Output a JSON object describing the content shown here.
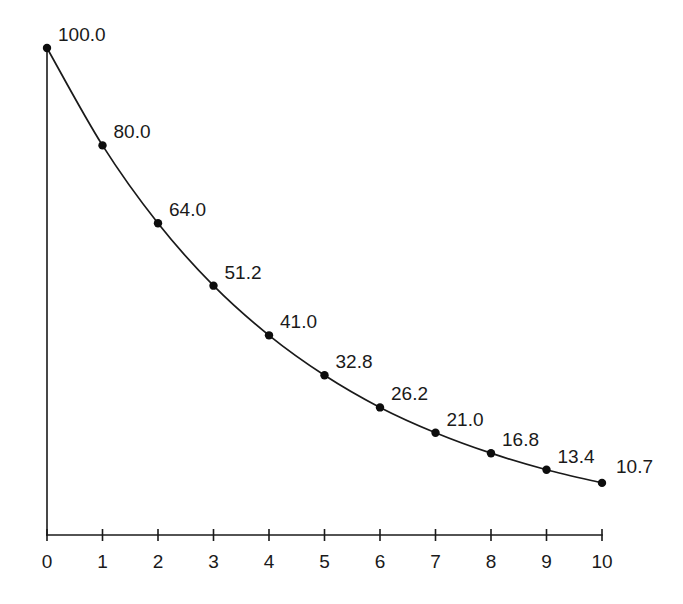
{
  "chart_data": {
    "type": "line",
    "title": "",
    "subtitle": "",
    "xlabel": "",
    "ylabel": "",
    "categories": [
      "0",
      "1",
      "2",
      "3",
      "4",
      "5",
      "6",
      "7",
      "8",
      "9",
      "10"
    ],
    "x": [
      0,
      1,
      2,
      3,
      4,
      5,
      6,
      7,
      8,
      9,
      10
    ],
    "values": [
      100.0,
      80.0,
      64.0,
      51.2,
      41.0,
      32.8,
      26.2,
      21.0,
      16.8,
      13.4,
      10.7
    ],
    "point_labels": [
      "100.0",
      "80.0",
      "64.0",
      "51.2",
      "41.0",
      "32.8",
      "26.2",
      "21.0",
      "16.8",
      "13.4",
      "10.7"
    ],
    "xtick_labels": [
      "0",
      "1",
      "2",
      "3",
      "4",
      "5",
      "6",
      "7",
      "8",
      "9",
      "10"
    ],
    "ytick_labels": [],
    "xlim": [
      0,
      10
    ],
    "ylim": [
      0,
      100
    ],
    "grid": false,
    "legend": [],
    "legend_position": "none",
    "series": [
      {
        "name": "",
        "values": [
          100.0,
          80.0,
          64.0,
          51.2,
          41.0,
          32.8,
          26.2,
          21.0,
          16.8,
          13.4,
          10.7
        ],
        "color": "#1a1a1a",
        "marker": "circle",
        "show_labels": true
      }
    ],
    "colors": {
      "line": "#1a1a1a",
      "marker": "#0d0d0d",
      "axis": "#1a1a1a",
      "text": "#1a1a1a",
      "background": "#ffffff"
    }
  }
}
